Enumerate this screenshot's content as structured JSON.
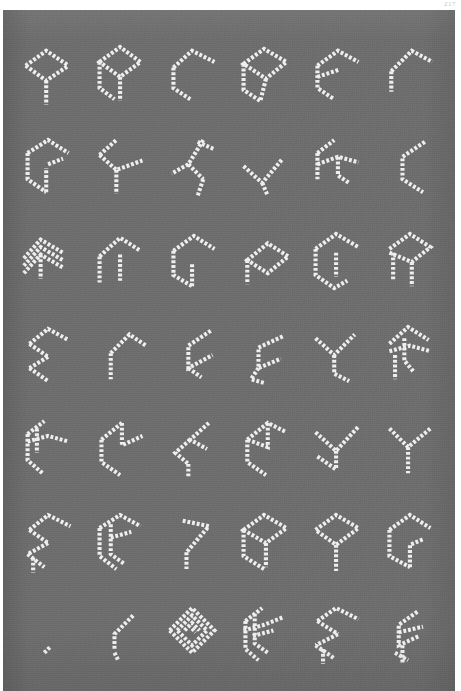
{
  "page": {
    "page_number": "217",
    "background_color": "#ffffff",
    "plate_color": "#6e6e6e",
    "ink_color": "#f4f4f4"
  },
  "chart": {
    "type": "glyph-grid",
    "columns": 6,
    "rows": 7,
    "total_cells": 42
  },
  "glyphs": [
    {
      "id": "r1c1",
      "row": 1,
      "col": 1,
      "name": "glyph-arrowhead-stem",
      "paths": [
        "M10,34 L32,18 L56,34",
        "M10,34 L32,50 L56,34",
        "M32,50 L32,76"
      ]
    },
    {
      "id": "r1c2",
      "row": 1,
      "col": 2,
      "name": "glyph-diamond-double-leg",
      "paths": [
        "M12,30 L34,14 L56,30 L34,46 Z",
        "M12,30 L12,58 L28,70",
        "M34,46 L34,72"
      ]
    },
    {
      "id": "r1c3",
      "row": 1,
      "col": 3,
      "name": "glyph-open-hook-left",
      "paths": [
        "M14,36 L34,18 L58,30",
        "M14,36 L14,58 L32,70"
      ]
    },
    {
      "id": "r1c4",
      "row": 1,
      "col": 4,
      "name": "glyph-diamond-tail",
      "paths": [
        "M12,32 L34,16 L58,30 L36,48 Z",
        "M12,32 L12,60 L30,72",
        "M36,48 L30,72"
      ]
    },
    {
      "id": "r1c5",
      "row": 1,
      "col": 5,
      "name": "glyph-e-bracket",
      "paths": [
        "M14,34 L36,18 L58,30",
        "M14,34 L14,58 L32,70",
        "M14,46 L38,38"
      ]
    },
    {
      "id": "r1c6",
      "row": 1,
      "col": 6,
      "name": "glyph-chevron-upper",
      "paths": [
        "M16,40 L38,18 L60,30",
        "M16,40 L16,62"
      ]
    },
    {
      "id": "r2c1",
      "row": 2,
      "col": 1,
      "name": "glyph-g-loop",
      "paths": [
        "M12,28 L34,14 L56,28",
        "M12,28 L12,56 L32,70",
        "M32,70 L32,44",
        "M34,40 L50,34"
      ]
    },
    {
      "id": "r2c2",
      "row": 2,
      "col": 2,
      "name": "glyph-y-fork-right",
      "paths": [
        "M12,30 L30,14",
        "M12,30 L30,46 L58,36",
        "M30,46 L30,72"
      ]
    },
    {
      "id": "r2c3",
      "row": 2,
      "col": 3,
      "name": "glyph-zigzag-bar",
      "paths": [
        "M40,16 L58,24",
        "M46,14 L30,40 L46,56",
        "M30,40 L12,50",
        "M46,56 L40,74"
      ]
    },
    {
      "id": "r2c4",
      "row": 2,
      "col": 4,
      "name": "glyph-v-hook",
      "paths": [
        "M12,42 L32,60 L54,34",
        "M32,60 L38,74"
      ]
    },
    {
      "id": "r2c5",
      "row": 2,
      "col": 5,
      "name": "glyph-double-fork",
      "paths": [
        "M14,28 L32,14",
        "M14,28 L14,56",
        "M14,40 L36,32 L58,38",
        "M36,32 L36,52 L48,60"
      ]
    },
    {
      "id": "r2c6",
      "row": 2,
      "col": 6,
      "name": "glyph-c-arc",
      "paths": [
        "M52,16 L28,32 L28,56 L50,70"
      ]
    },
    {
      "id": "r3c1",
      "row": 3,
      "col": 1,
      "name": "glyph-triple-chevron",
      "paths": [
        "M8,40 L26,20 L50,34",
        "M8,48 L26,28 L50,42",
        "M8,56 L26,36 L50,50",
        "M26,36 L26,62"
      ]
    },
    {
      "id": "r3c2",
      "row": 3,
      "col": 2,
      "name": "glyph-n-arch",
      "paths": [
        "M12,38 L34,18 L56,32",
        "M12,38 L12,66",
        "M34,36 L34,64"
      ]
    },
    {
      "id": "r3c3",
      "row": 3,
      "col": 3,
      "name": "glyph-p-bowl-open",
      "paths": [
        "M14,32 L36,16 L58,30",
        "M14,32 L14,58 L34,70",
        "M34,70 L34,46"
      ]
    },
    {
      "id": "r3c4",
      "row": 3,
      "col": 4,
      "name": "glyph-flag-diamond",
      "paths": [
        "M16,42 L38,24 L60,38 L38,56 Z",
        "M16,42 L16,68"
      ]
    },
    {
      "id": "r3c5",
      "row": 3,
      "col": 5,
      "name": "glyph-bowl-curl",
      "paths": [
        "M12,30 L34,14 L58,28",
        "M12,30 L12,58 L32,72 L46,64",
        "M34,34 L34,60"
      ]
    },
    {
      "id": "r3c6",
      "row": 3,
      "col": 6,
      "name": "glyph-r-leg",
      "paths": [
        "M14,30 L36,14 L58,28 L38,44 L14,34",
        "M18,34 L18,64",
        "M38,44 L38,70"
      ]
    },
    {
      "id": "r4c1",
      "row": 4,
      "col": 1,
      "name": "glyph-s-angular",
      "paths": [
        "M14,32 L34,16 L56,28",
        "M14,32 L34,46",
        "M34,46 L14,58",
        "M14,58 L34,72"
      ]
    },
    {
      "id": "r4c2",
      "row": 4,
      "col": 2,
      "name": "glyph-t-bar-leg",
      "paths": [
        "M24,42 L44,22 L62,34",
        "M24,42 L24,70"
      ]
    },
    {
      "id": "r4c3",
      "row": 4,
      "col": 3,
      "name": "glyph-c-wide",
      "paths": [
        "M54,18 L30,34 L30,58 L56,44",
        "M30,58 L44,68"
      ]
    },
    {
      "id": "r4c4",
      "row": 4,
      "col": 4,
      "name": "glyph-c-curl-foot",
      "paths": [
        "M54,24 L28,36 L28,58 L52,48",
        "M28,58 L20,70 L34,74"
      ]
    },
    {
      "id": "r4c5",
      "row": 4,
      "col": 5,
      "name": "glyph-y-three-arm",
      "paths": [
        "M12,26 L32,44 L54,22",
        "M32,44 L32,64 L48,72"
      ]
    },
    {
      "id": "r4c6",
      "row": 4,
      "col": 6,
      "name": "glyph-k-cross",
      "paths": [
        "M14,32 L34,14 L56,28",
        "M14,40 L36,34 L58,40",
        "M30,26 L30,50 L40,62",
        "M20,44 L20,70"
      ]
    },
    {
      "id": "r5c1",
      "row": 5,
      "col": 1,
      "name": "glyph-f-double-bar",
      "paths": [
        "M12,28 L30,14",
        "M12,28 L12,56 L28,70",
        "M12,36 L34,30 L56,36",
        "M22,22 L22,48"
      ]
    },
    {
      "id": "r5c2",
      "row": 5,
      "col": 2,
      "name": "glyph-z-angular",
      "paths": [
        "M14,34 L36,16",
        "M36,16 L36,40 L58,30",
        "M14,34 L14,58 L34,72"
      ]
    },
    {
      "id": "r5c3",
      "row": 5,
      "col": 3,
      "name": "glyph-lightning",
      "paths": [
        "M52,16 L32,34 L50,44",
        "M32,34 L16,48 L30,60",
        "M30,60 L30,74"
      ]
    },
    {
      "id": "r5c4",
      "row": 5,
      "col": 4,
      "name": "glyph-z-wide",
      "paths": [
        "M16,34 L38,16 L58,26",
        "M38,16 L38,42 L16,34",
        "M16,34 L16,58 L36,72"
      ]
    },
    {
      "id": "r5c5",
      "row": 5,
      "col": 5,
      "name": "glyph-y-deep-fork",
      "paths": [
        "M12,26 L34,46 L58,20",
        "M34,46 L34,66",
        "M14,52 L34,66"
      ]
    },
    {
      "id": "r5c6",
      "row": 5,
      "col": 6,
      "name": "glyph-y-simple",
      "paths": [
        "M14,22 L34,42 L58,22",
        "M34,42 L34,70"
      ]
    },
    {
      "id": "r6c1",
      "row": 6,
      "col": 1,
      "name": "glyph-s-double-angular",
      "paths": [
        "M14,30 L34,14 L58,26",
        "M14,30 L34,44",
        "M34,44 L12,56",
        "M12,56 L30,70",
        "M18,60 L18,76"
      ]
    },
    {
      "id": "r6c2",
      "row": 6,
      "col": 2,
      "name": "glyph-g-box",
      "paths": [
        "M12,28 L34,14 L56,26",
        "M12,28 L12,58 L30,72",
        "M24,24 L24,56 L38,66",
        "M24,38 L46,32"
      ]
    },
    {
      "id": "r6c3",
      "row": 6,
      "col": 3,
      "name": "glyph-arrow-seven",
      "paths": [
        "M24,20 L52,26 L28,54",
        "M28,54 L28,72"
      ]
    },
    {
      "id": "r6c4",
      "row": 6,
      "col": 4,
      "name": "glyph-cube-left",
      "paths": [
        "M12,30 L34,14 L58,28 L36,44 Z",
        "M12,30 L12,58 L34,72",
        "M36,44 L36,70"
      ]
    },
    {
      "id": "r6c5",
      "row": 6,
      "col": 5,
      "name": "glyph-diamond-stem",
      "paths": [
        "M12,30 L34,14 L58,28 L34,46 Z",
        "M34,46 L34,74"
      ]
    },
    {
      "id": "r6c6",
      "row": 6,
      "col": 6,
      "name": "glyph-bowl-hook",
      "paths": [
        "M14,30 L36,14 L58,28",
        "M14,30 L14,58 L36,70",
        "M36,70 L36,46 L50,40"
      ]
    },
    {
      "id": "r7c1",
      "row": 7,
      "col": 1,
      "name": "glyph-dot-tick",
      "paths": [
        "M30,62 L36,56"
      ]
    },
    {
      "id": "r7c2",
      "row": 7,
      "col": 2,
      "name": "glyph-comma-hook",
      "paths": [
        "M48,22 L28,42 L28,58",
        "M28,62 L32,70"
      ]
    },
    {
      "id": "r7c3",
      "row": 7,
      "col": 3,
      "name": "glyph-nested-hexagon",
      "paths": [
        "M10,38 L34,14 L58,38 L34,62 Z",
        "M18,38 L34,22 L50,38 L34,54 Z",
        "M26,38 L34,30 L42,38",
        "M34,36 L38,40"
      ]
    },
    {
      "id": "r7c4",
      "row": 7,
      "col": 4,
      "name": "glyph-hash-fork",
      "paths": [
        "M14,28 L32,14",
        "M14,28 L14,58 L28,70",
        "M12,38 L34,32 L54,24",
        "M24,20 L24,52 L38,62",
        "M22,44 L44,38"
      ]
    },
    {
      "id": "r7c5",
      "row": 7,
      "col": 5,
      "name": "glyph-s-zigzag-heavy",
      "paths": [
        "M14,28 L34,14 L58,26",
        "M14,28 L36,42",
        "M36,42 L12,54",
        "M12,54 L32,68",
        "M20,58 L20,74"
      ]
    },
    {
      "id": "r7c6",
      "row": 7,
      "col": 6,
      "name": "glyph-c-cross-leg",
      "paths": [
        "M44,18 L24,32 L24,54 L46,44",
        "M24,40 L50,34",
        "M28,54 L28,74",
        "M20,62 L34,70"
      ]
    }
  ]
}
